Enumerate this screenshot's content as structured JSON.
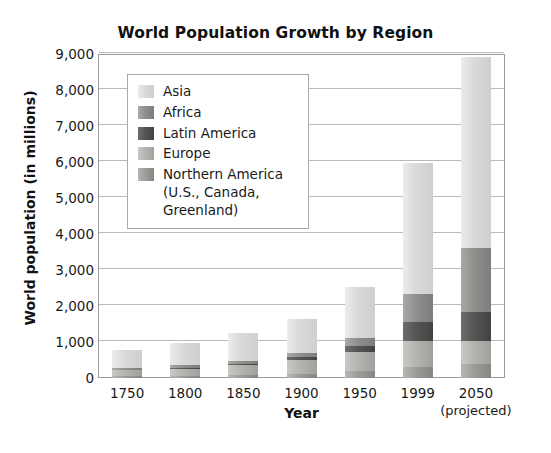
{
  "chart_data": {
    "type": "bar",
    "subtype": "stacked-column",
    "title": "World Population Growth by Region",
    "xlabel": "Year",
    "ylabel": "World population (in millions)",
    "categories": [
      "1750",
      "1800",
      "1850",
      "1900",
      "1950",
      "1999",
      "2050"
    ],
    "category_sublabels": [
      "",
      "",
      "",
      "",
      "",
      "",
      "(projected)"
    ],
    "ylim": [
      0,
      9000
    ],
    "yticks": [
      0,
      1000,
      2000,
      3000,
      4000,
      5000,
      6000,
      7000,
      8000,
      9000
    ],
    "ytick_labels": [
      "0",
      "1,000",
      "2,000",
      "3,000",
      "4,000",
      "5,000",
      "6,000",
      "7,000",
      "8,000",
      "9,000"
    ],
    "grid": true,
    "grid_axis": "y",
    "legend_position": "inside-upper-left",
    "stack_order_bottom_to_top": [
      "Northern America (U.S., Canada, Greenland)",
      "Europe",
      "Latin America",
      "Africa",
      "Asia"
    ],
    "series": [
      {
        "name": "Asia",
        "legend_label": "Asia",
        "color": "#d9d9d9",
        "color_light": "#ececeb",
        "color_dark": "#cfcfcd",
        "values": [
          500,
          625,
          795,
          960,
          1400,
          3650,
          5290
        ]
      },
      {
        "name": "Africa",
        "legend_label": "Africa",
        "color": "#8f8f8d",
        "color_light": "#a9a9a6",
        "color_dark": "#7d7d7b",
        "values": [
          60,
          70,
          80,
          110,
          220,
          780,
          1790
        ]
      },
      {
        "name": "Latin America",
        "legend_label": "Latin America",
        "color": "#555553",
        "color_light": "#6d6d6b",
        "color_dark": "#434341",
        "values": [
          15,
          25,
          35,
          70,
          165,
          510,
          810
        ]
      },
      {
        "name": "Europe",
        "legend_label": "Europe",
        "color": "#b4b4b1",
        "color_light": "#c8c8c5",
        "color_dark": "#a0a09d",
        "values": [
          165,
          205,
          275,
          410,
          545,
          730,
          640
        ]
      },
      {
        "name": "Northern America",
        "legend_label": "Northern America",
        "legend_label_cont_1": "(U.S., Canada,",
        "legend_label_cont_2": "Greenland)",
        "color": "#9c9c99",
        "color_light": "#b6b6b3",
        "color_dark": "#858582",
        "values": [
          50,
          55,
          75,
          100,
          190,
          310,
          380
        ]
      }
    ],
    "totals": [
      790,
      980,
      1260,
      1650,
      2520,
      5980,
      8910
    ]
  },
  "chart": {
    "title": "World Population Growth by Region",
    "ylabel": "World population (in millions)",
    "xlabel": "Year"
  }
}
